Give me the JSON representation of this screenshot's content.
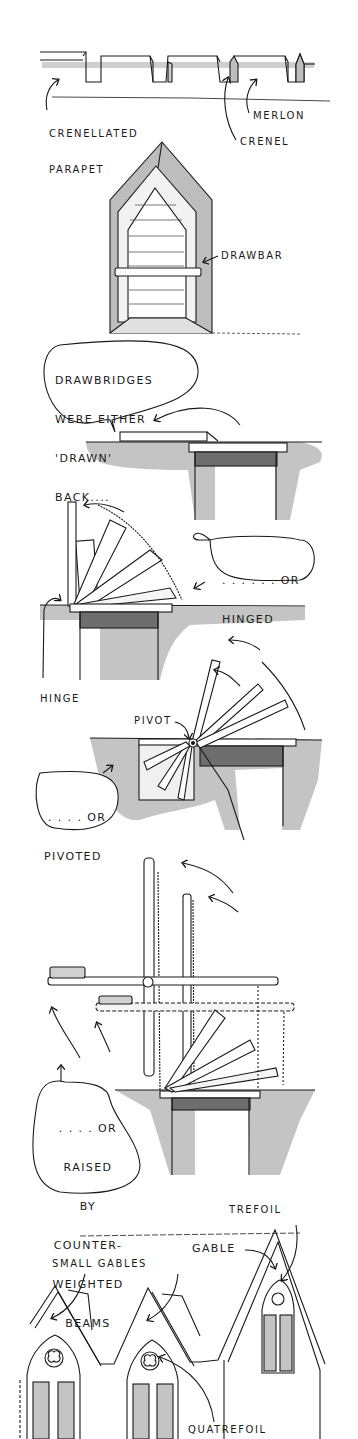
{
  "figure": {
    "colors": {
      "ink": "#1a1a1a",
      "shade": "#bdbdbd",
      "dark_shade": "#7a7a7a",
      "paper": "#ffffff"
    }
  },
  "sections": {
    "parapet": {
      "labels": {
        "crenellated_parapet_1": "CRENELLATED",
        "crenellated_parapet_2": "PARAPET",
        "merlon": "MERLON",
        "crenel": "CRENEL"
      }
    },
    "door": {
      "labels": {
        "drawbar": "DRAWBAR"
      }
    },
    "drawn": {
      "bubble": [
        "DRAWBRIDGES",
        "WERE EITHER",
        "'DRAWN'",
        "BACK...."
      ]
    },
    "hinged": {
      "bubble": [
        ". . . . . . OR",
        "HINGED"
      ],
      "labels": {
        "hinge": "HINGE"
      }
    },
    "pivoted": {
      "bubble": [
        ". . . . OR",
        "PIVOTED"
      ],
      "labels": {
        "pivot": "PIVOT"
      }
    },
    "counterweighted": {
      "bubble": [
        ". . . . OR",
        "RAISED",
        "BY",
        "COUNTER-",
        "WEIGHTED",
        "BEAMS"
      ]
    },
    "gables": {
      "labels": {
        "trefoil": "TREFOIL",
        "gable": "GABLE",
        "small_gables": "SMALL GABLES",
        "quatrefoil": "QUATREFOIL"
      }
    }
  }
}
